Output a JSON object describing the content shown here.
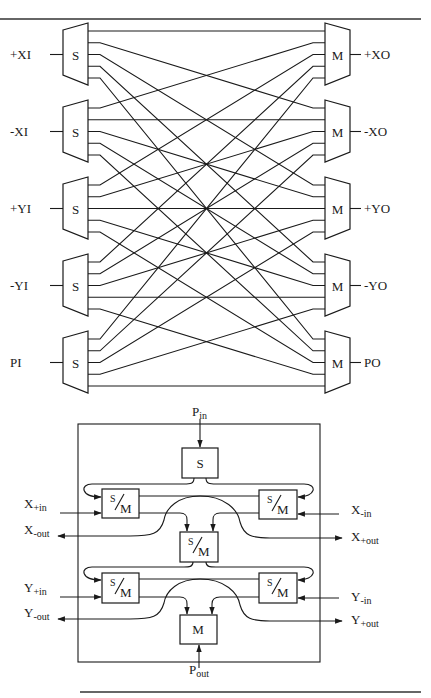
{
  "top_diagram": {
    "title": "Crossbar network of split (S) and merge (M) units",
    "inputs": [
      {
        "label": "+XI",
        "unit": "S"
      },
      {
        "label": "-XI",
        "unit": "S"
      },
      {
        "label": "+YI",
        "unit": "S"
      },
      {
        "label": "-YI",
        "unit": "S"
      },
      {
        "label": "PI",
        "unit": "S"
      }
    ],
    "outputs": [
      {
        "label": "+XO",
        "unit": "M"
      },
      {
        "label": "-XO",
        "unit": "M"
      },
      {
        "label": "+YO",
        "unit": "M"
      },
      {
        "label": "-YO",
        "unit": "M"
      },
      {
        "label": "PO",
        "unit": "M"
      }
    ],
    "connection_rule": "S unit i output j connects to M unit j input i (full 5x5 crossbar)"
  },
  "bottom_diagram": {
    "title": "Router block with split/merge units",
    "p_in": {
      "main": "P",
      "sub": "in"
    },
    "p_out": {
      "main": "P",
      "sub": "out"
    },
    "s_unit": "S",
    "m_unit": "M",
    "sm_label": {
      "s": "S",
      "m": "M"
    },
    "x_plus_in": {
      "main": "X",
      "sub": "+in"
    },
    "x_minus_out": {
      "main": "X",
      "sub": "-out"
    },
    "x_minus_in": {
      "main": "X",
      "sub": "-in"
    },
    "x_plus_out": {
      "main": "X",
      "sub": "+out"
    },
    "y_plus_in": {
      "main": "Y",
      "sub": "+in"
    },
    "y_minus_out": {
      "main": "Y",
      "sub": "-out"
    },
    "y_minus_in": {
      "main": "Y",
      "sub": "-in"
    },
    "y_plus_out": {
      "main": "Y",
      "sub": "+out"
    }
  }
}
